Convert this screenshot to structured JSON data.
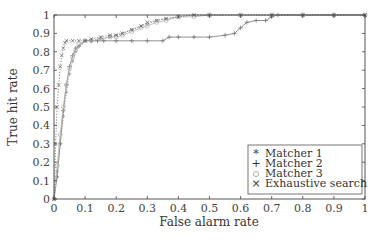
{
  "chart_data": {
    "type": "line",
    "title": "",
    "xlabel": "False alarm rate",
    "ylabel": "True hit rate",
    "xlim": [
      0,
      1
    ],
    "ylim": [
      0,
      1
    ],
    "xticks": [
      "0",
      "0.1",
      "0.2",
      "0.3",
      "0.4",
      "0.5",
      "0.6",
      "0.7",
      "0.8",
      "0.9",
      "1"
    ],
    "yticks": [
      "0",
      "0.1",
      "0.2",
      "0.3",
      "0.4",
      "0.5",
      "0.6",
      "0.7",
      "0.8",
      "0.9",
      "1"
    ],
    "grid": false,
    "legend_position": "lower right",
    "series": [
      {
        "name": "Matcher 1",
        "marker": "*",
        "line": "dotted",
        "x": [
          0,
          0.01,
          0.02,
          0.03,
          0.04,
          0.05,
          0.06,
          0.07,
          0.08,
          0.1,
          0.12,
          0.15,
          0.18,
          0.2,
          0.22,
          0.25,
          0.28,
          0.3,
          0.33,
          0.36,
          0.4,
          0.45,
          0.5,
          0.6,
          0.7,
          0.8,
          0.9,
          1.0
        ],
        "y": [
          0,
          0.15,
          0.3,
          0.45,
          0.58,
          0.68,
          0.75,
          0.8,
          0.83,
          0.86,
          0.86,
          0.87,
          0.88,
          0.89,
          0.9,
          0.92,
          0.94,
          0.95,
          0.97,
          0.98,
          0.99,
          1.0,
          1.0,
          1.0,
          1.0,
          1.0,
          1.0,
          1.0
        ]
      },
      {
        "name": "Matcher 2",
        "marker": "+",
        "line": "solid",
        "x": [
          0,
          0.01,
          0.02,
          0.03,
          0.04,
          0.05,
          0.06,
          0.07,
          0.08,
          0.1,
          0.12,
          0.14,
          0.16,
          0.2,
          0.25,
          0.3,
          0.35,
          0.37,
          0.4,
          0.45,
          0.5,
          0.55,
          0.58,
          0.6,
          0.62,
          0.65,
          0.68,
          0.7,
          0.72,
          0.8,
          0.9,
          1.0
        ],
        "y": [
          0,
          0.12,
          0.3,
          0.48,
          0.62,
          0.72,
          0.78,
          0.82,
          0.83,
          0.86,
          0.86,
          0.86,
          0.86,
          0.86,
          0.86,
          0.86,
          0.86,
          0.88,
          0.88,
          0.88,
          0.88,
          0.89,
          0.9,
          0.93,
          0.96,
          0.97,
          0.97,
          0.99,
          1.0,
          1.0,
          1.0,
          1.0
        ]
      },
      {
        "name": "Matcher 3",
        "marker": "o",
        "line": "solid",
        "x": [
          0,
          0.01,
          0.02,
          0.03,
          0.04,
          0.05,
          0.06,
          0.07,
          0.08,
          0.1,
          0.12,
          0.15,
          0.18,
          0.2,
          0.22,
          0.25,
          0.28,
          0.3,
          0.33,
          0.36,
          0.4,
          0.45,
          0.5,
          0.6,
          0.7,
          0.8,
          0.9,
          1.0
        ],
        "y": [
          0,
          0.18,
          0.35,
          0.5,
          0.62,
          0.71,
          0.77,
          0.81,
          0.84,
          0.86,
          0.86,
          0.87,
          0.88,
          0.88,
          0.89,
          0.91,
          0.93,
          0.94,
          0.96,
          0.97,
          0.99,
          0.99,
          1.0,
          1.0,
          1.0,
          1.0,
          1.0,
          1.0
        ]
      },
      {
        "name": "Exhaustive search",
        "marker": "x",
        "line": "dotted",
        "x": [
          0,
          0.005,
          0.01,
          0.015,
          0.02,
          0.025,
          0.03,
          0.035,
          0.04,
          0.06,
          0.08,
          0.1,
          0.12,
          0.15,
          0.18,
          0.2,
          0.22,
          0.25,
          0.28,
          0.3,
          0.33,
          0.36,
          0.4,
          0.45,
          0.5,
          0.6,
          0.7,
          0.8,
          0.9,
          1.0
        ],
        "y": [
          0,
          0.3,
          0.5,
          0.62,
          0.72,
          0.78,
          0.82,
          0.85,
          0.86,
          0.86,
          0.86,
          0.86,
          0.87,
          0.88,
          0.89,
          0.89,
          0.9,
          0.92,
          0.94,
          0.96,
          0.97,
          0.98,
          0.99,
          1.0,
          1.0,
          1.0,
          1.0,
          1.0,
          1.0,
          1.0
        ]
      }
    ]
  },
  "legend": {
    "items": [
      {
        "label": "Matcher 1",
        "marker": "*"
      },
      {
        "label": "Matcher 2",
        "marker": "+"
      },
      {
        "label": "Matcher 3",
        "marker": "o"
      },
      {
        "label": "Exhaustive search",
        "marker": "x"
      }
    ]
  },
  "colors": {
    "axis": "#444444",
    "series": "#777777",
    "text": "#333333",
    "background": "#ffffff"
  }
}
